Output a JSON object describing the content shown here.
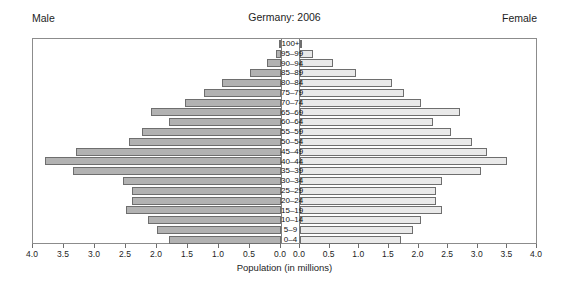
{
  "header": {
    "title": "Germany: 2006",
    "male_label": "Male",
    "female_label": "Female"
  },
  "axis": {
    "title": "Population (in millions)",
    "left_ticks": [
      "4.0",
      "3.5",
      "3.0",
      "2.5",
      "2.0",
      "1.5",
      "1.0",
      "0.5",
      "0.0"
    ],
    "right_ticks": [
      "0.0",
      "0.5",
      "1.0",
      "1.5",
      "2.0",
      "2.5",
      "3.0",
      "3.5",
      "4.0"
    ]
  },
  "colors": {
    "male_bar": "#b2b2b2",
    "female_bar": "#e9e9e9",
    "bar_border": "#6e6e6e",
    "frame": "#8c8c8c"
  },
  "chart_data": {
    "type": "bar",
    "subtype": "population-pyramid",
    "title": "Germany: 2006",
    "xlabel": "Population (in millions)",
    "ylabel": "",
    "xlim": [
      0,
      4.0
    ],
    "xtick_step": 0.5,
    "grid": false,
    "legend": "none",
    "orientation": "horizontal",
    "categories": [
      "100+",
      "95–99",
      "90–94",
      "85–89",
      "80–84",
      "75–79",
      "70–74",
      "65–69",
      "60–64",
      "55–59",
      "50–54",
      "45–49",
      "40–44",
      "35–39",
      "30–34",
      "25–29",
      "20–24",
      "15–19",
      "10–14",
      "5–9",
      "0–4"
    ],
    "series": [
      {
        "name": "Male",
        "side": "left",
        "units": "millions",
        "values": [
          0.01,
          0.08,
          0.22,
          0.5,
          0.95,
          1.25,
          1.55,
          2.1,
          1.8,
          2.25,
          2.45,
          3.3,
          3.8,
          3.35,
          2.55,
          2.4,
          2.4,
          2.5,
          2.15,
          2.0,
          1.8
        ]
      },
      {
        "name": "Female",
        "side": "right",
        "units": "millions",
        "values": [
          0.04,
          0.22,
          0.55,
          0.95,
          1.55,
          1.75,
          2.05,
          2.7,
          2.25,
          2.55,
          2.9,
          3.15,
          3.5,
          3.05,
          2.4,
          2.3,
          2.3,
          2.4,
          2.05,
          1.9,
          1.7
        ]
      }
    ]
  }
}
